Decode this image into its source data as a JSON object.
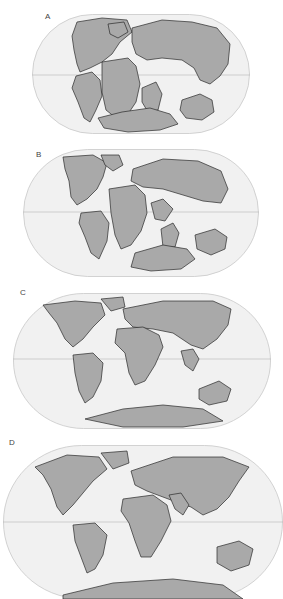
{
  "figure": {
    "panels": [
      {
        "label": "A",
        "description": "Pangaea supercontinent assembled"
      },
      {
        "label": "B",
        "description": "Pangaea breaking apart; Atlantic opening"
      },
      {
        "label": "C",
        "description": "Continents near modern positions; India drifting north"
      },
      {
        "label": "D",
        "description": "Present-day configuration"
      }
    ]
  },
  "colors": {
    "land": "#a9a9a9",
    "ocean": "#f1f1f1",
    "coastline": "#2a2a2a",
    "equator": "#bdbdbd",
    "label": "#444444"
  }
}
